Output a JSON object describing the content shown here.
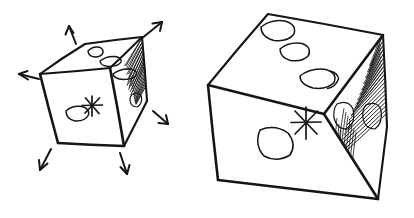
{
  "figure": {
    "title": "Hand-drawn cube scaling illustration",
    "background_color": "#ffffff",
    "ink_color": "#151515",
    "canvas": {
      "width": 414,
      "height": 218
    }
  },
  "objects": [
    {
      "id": "small-cube",
      "label": "Small cube",
      "role": "before-scaling",
      "faces": [
        {
          "id": "top",
          "label": "Top face",
          "pip_count": 3
        },
        {
          "id": "front",
          "label": "Front face",
          "pip_count": 1,
          "mark": "asterisk"
        },
        {
          "id": "right",
          "label": "Right face",
          "pip_count": 1,
          "shading": "hatched"
        }
      ],
      "mark_glyph": "*",
      "arrow_count": 6
    },
    {
      "id": "large-cube",
      "label": "Large cube",
      "role": "after-scaling",
      "faces": [
        {
          "id": "top",
          "label": "Top face",
          "pip_count": 3
        },
        {
          "id": "front",
          "label": "Front face",
          "pip_count": 1,
          "mark": "asterisk"
        },
        {
          "id": "right",
          "label": "Right face",
          "pip_count": 2,
          "shading": "hatched"
        }
      ],
      "mark_glyph": "*",
      "arrow_count": 0
    }
  ],
  "arrows": [
    {
      "id": "arrow-up-left",
      "label": "Arrow pointing up and left",
      "direction": "up-left"
    },
    {
      "id": "arrow-up-right",
      "label": "Arrow pointing up and right",
      "direction": "up-right"
    },
    {
      "id": "arrow-left",
      "label": "Arrow pointing left",
      "direction": "left"
    },
    {
      "id": "arrow-right-down",
      "label": "Arrow pointing right and down",
      "direction": "right-down"
    },
    {
      "id": "arrow-down-left",
      "label": "Arrow pointing down and left",
      "direction": "down-left"
    },
    {
      "id": "arrow-down",
      "label": "Arrow pointing down",
      "direction": "down"
    }
  ]
}
